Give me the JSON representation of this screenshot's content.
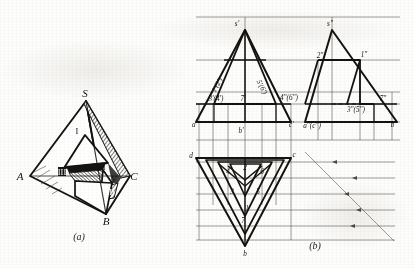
{
  "figure": {
    "captions": {
      "left": "(a)",
      "right": "(b)"
    },
    "colors": {
      "ink": "#15130f",
      "paper": "#fdfdfc",
      "thin": "#3a352c"
    }
  },
  "pictorial": {
    "name": "tetrahedron-pictorial",
    "vertex_labels": [
      {
        "id": "S",
        "text": "S",
        "x": 88,
        "y": 95
      },
      {
        "id": "A",
        "text": "A",
        "x": 20,
        "y": 177
      },
      {
        "id": "B",
        "text": "B",
        "x": 106,
        "y": 219
      },
      {
        "id": "C",
        "text": "C",
        "x": 131,
        "y": 177
      }
    ],
    "face_labels": [
      {
        "id": "I",
        "text": "I",
        "x": 75,
        "y": 131
      },
      {
        "id": "III",
        "text": "III",
        "x": 61,
        "y": 172
      },
      {
        "id": "VI",
        "text": "VI",
        "x": 100,
        "y": 167
      },
      {
        "id": "V",
        "text": "V",
        "x": 113,
        "y": 180
      },
      {
        "id": "VII",
        "text": "VII",
        "x": 108,
        "y": 192
      }
    ]
  },
  "projection": {
    "name": "three-view-projection",
    "front_view": {
      "name": "front-view",
      "labels": [
        {
          "id": "s-prime",
          "text": "s'",
          "x": 237,
          "y": 26
        },
        {
          "id": "12-prime",
          "text": "1'(2')",
          "x": 219,
          "y": 86
        },
        {
          "id": "56-prime",
          "text": "5'(6')",
          "x": 258,
          "y": 88
        },
        {
          "id": "34-prime",
          "text": "3'(4')",
          "x": 216,
          "y": 110
        },
        {
          "id": "7-prime",
          "text": "7'",
          "x": 243,
          "y": 110
        },
        {
          "id": "a-prime",
          "text": "a'",
          "x": 192,
          "y": 128
        },
        {
          "id": "b-prime",
          "text": "b'",
          "x": 241,
          "y": 131
        },
        {
          "id": "c-prime",
          "text": "c'",
          "x": 292,
          "y": 128
        }
      ]
    },
    "side_view": {
      "name": "side-view",
      "labels": [
        {
          "id": "s-dprime",
          "text": "s\"",
          "x": 330,
          "y": 26
        },
        {
          "id": "2-dprime",
          "text": "2\"",
          "x": 322,
          "y": 66
        },
        {
          "id": "1-dprime",
          "text": "1\"",
          "x": 364,
          "y": 65
        },
        {
          "id": "46-dprime",
          "text": "4\"(6\")",
          "x": 289,
          "y": 97
        },
        {
          "id": "35-dprime",
          "text": "3\"(5\")",
          "x": 354,
          "y": 110
        },
        {
          "id": "7-dprime",
          "text": "7\"",
          "x": 383,
          "y": 103
        },
        {
          "id": "ac-dprime",
          "text": "a\"(c\")",
          "x": 312,
          "y": 129
        },
        {
          "id": "b-dprime",
          "text": "b\"",
          "x": 393,
          "y": 128
        }
      ]
    },
    "top_view": {
      "name": "top-view",
      "labels": [
        {
          "id": "d-top",
          "text": "d",
          "x": 191,
          "y": 156
        },
        {
          "id": "c-top",
          "text": "c",
          "x": 290,
          "y": 156
        },
        {
          "id": "4-top",
          "text": "4",
          "x": 228,
          "y": 172
        },
        {
          "id": "2-top",
          "text": "2",
          "x": 245,
          "y": 168
        },
        {
          "id": "6-top",
          "text": "6",
          "x": 262,
          "y": 172
        },
        {
          "id": "3-top",
          "text": "3",
          "x": 233,
          "y": 192
        },
        {
          "id": "5-top",
          "text": "5",
          "x": 258,
          "y": 192
        },
        {
          "id": "1-top",
          "text": "1",
          "x": 246,
          "y": 209
        },
        {
          "id": "7-top",
          "text": "7",
          "x": 243,
          "y": 221
        },
        {
          "id": "b-top",
          "text": "b",
          "x": 244,
          "y": 248
        }
      ]
    }
  }
}
